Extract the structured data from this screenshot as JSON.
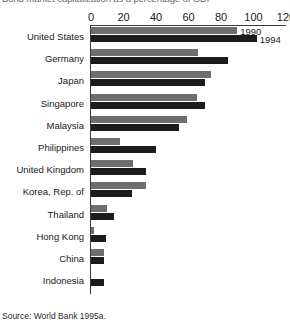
{
  "title": "Bond market capitalization as a percentage of GDP",
  "source": "Source: World Bank 1995a.",
  "legend": [
    {
      "label": "1990",
      "color": "#6e6e6e"
    },
    {
      "label": "1994",
      "color": "#1c1c1c"
    }
  ],
  "chart_data": {
    "type": "bar",
    "orientation": "horizontal",
    "title": "Bond market capitalization as a percentage of GDP",
    "xlabel": "",
    "ylabel": "",
    "xlim": [
      0,
      120
    ],
    "xticks": [
      0,
      20,
      40,
      60,
      80,
      100,
      120
    ],
    "xtick_labels": [
      "0",
      "20",
      "40",
      "60",
      "80",
      "100",
      "120"
    ],
    "grid": false,
    "legend_position": "inline-right-of-first-bars",
    "categories": [
      "United States",
      "Germany",
      "Japan",
      "Singapore",
      "Malaysia",
      "Philippines",
      "United Kingdom",
      "Korea, Rep. of",
      "Thailand",
      "Hong Kong",
      "China",
      "Indonesia"
    ],
    "series": [
      {
        "name": "1990",
        "color": "#6e6e6e",
        "values": [
          90,
          66,
          74,
          65,
          59,
          18,
          26,
          34,
          10,
          2,
          8,
          0
        ]
      },
      {
        "name": "1994",
        "color": "#1c1c1c",
        "values": [
          102,
          84,
          70,
          70,
          54,
          40,
          34,
          25,
          14,
          9,
          8,
          8
        ]
      }
    ]
  }
}
